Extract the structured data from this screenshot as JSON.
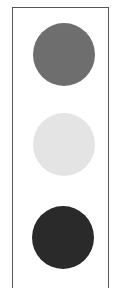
{
  "figure": {
    "type": "traffic-light-style stack of circles",
    "frame": {
      "border_color": "#555555",
      "background": "#ffffff"
    },
    "circles": [
      {
        "position": "top",
        "label": "medium gray circle",
        "color": "#6e6e6e"
      },
      {
        "position": "middle",
        "label": "light gray circle",
        "color": "#e4e4e4"
      },
      {
        "position": "bottom",
        "label": "dark gray circle",
        "color": "#2a2a2a"
      }
    ]
  }
}
